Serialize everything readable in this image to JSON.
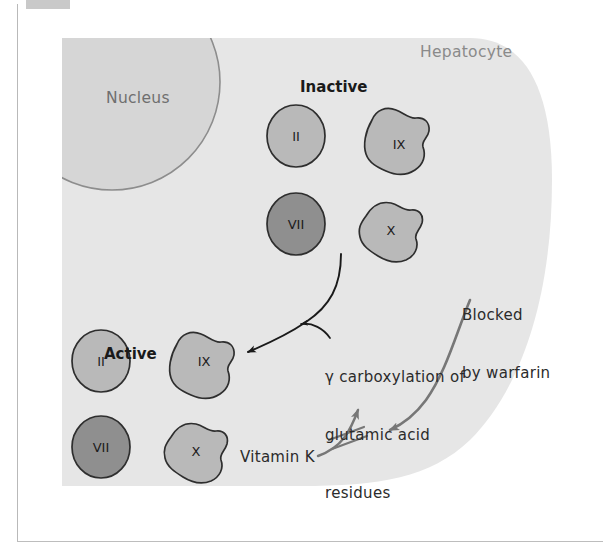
{
  "figure": {
    "cell_label": "Hepatocyte",
    "nucleus_label": "Nucleus",
    "group_inactive_label": "Inactive",
    "group_active_label": "Active",
    "process_label_line1": "γ carboxylation of",
    "process_label_line2": "glutamic acid",
    "process_label_line3": "residues",
    "blocked_label_line1": "Blocked",
    "blocked_label_line2": "by warfarin",
    "vitamin_label": "Vitamin K"
  },
  "factors": {
    "inactive": [
      {
        "name": "II",
        "shape": "circle",
        "tone": "light"
      },
      {
        "name": "IX",
        "shape": "blob",
        "tone": "light"
      },
      {
        "name": "VII",
        "shape": "circle",
        "tone": "dark"
      },
      {
        "name": "X",
        "shape": "blob",
        "tone": "light"
      }
    ],
    "active": [
      {
        "name": "II",
        "shape": "circle",
        "tone": "light"
      },
      {
        "name": "IX",
        "shape": "blob",
        "tone": "light"
      },
      {
        "name": "VII",
        "shape": "circle",
        "tone": "dark"
      },
      {
        "name": "X",
        "shape": "blob",
        "tone": "light"
      }
    ]
  },
  "colors": {
    "page_background": "#ffffff",
    "cytoplasm": "#e6e6e6",
    "nucleus_fill": "#d2d2d2",
    "nucleus_stroke": "#909090",
    "factor_light_fill": "#b8b8b8",
    "factor_dark_fill": "#8f8f8f",
    "factor_stroke": "#2e2e2e",
    "arrow_black": "#1a1a1a",
    "arrow_gray": "#777777",
    "text_dark": "#2b2b2b",
    "text_gray": "#8a8a8a",
    "frame_line": "#bdbdbd",
    "scan_tab": "#c9c9c9"
  },
  "icons": {
    "conversion_arrow": "curved-arrow-icon",
    "process_pointer_arrow": "small-curved-arrow-icon",
    "warfarin_arrow": "gray-curved-arrow-icon",
    "vitamin_arrow": "up-arrow-icon",
    "block_marks": "double-slash-block-icon"
  }
}
